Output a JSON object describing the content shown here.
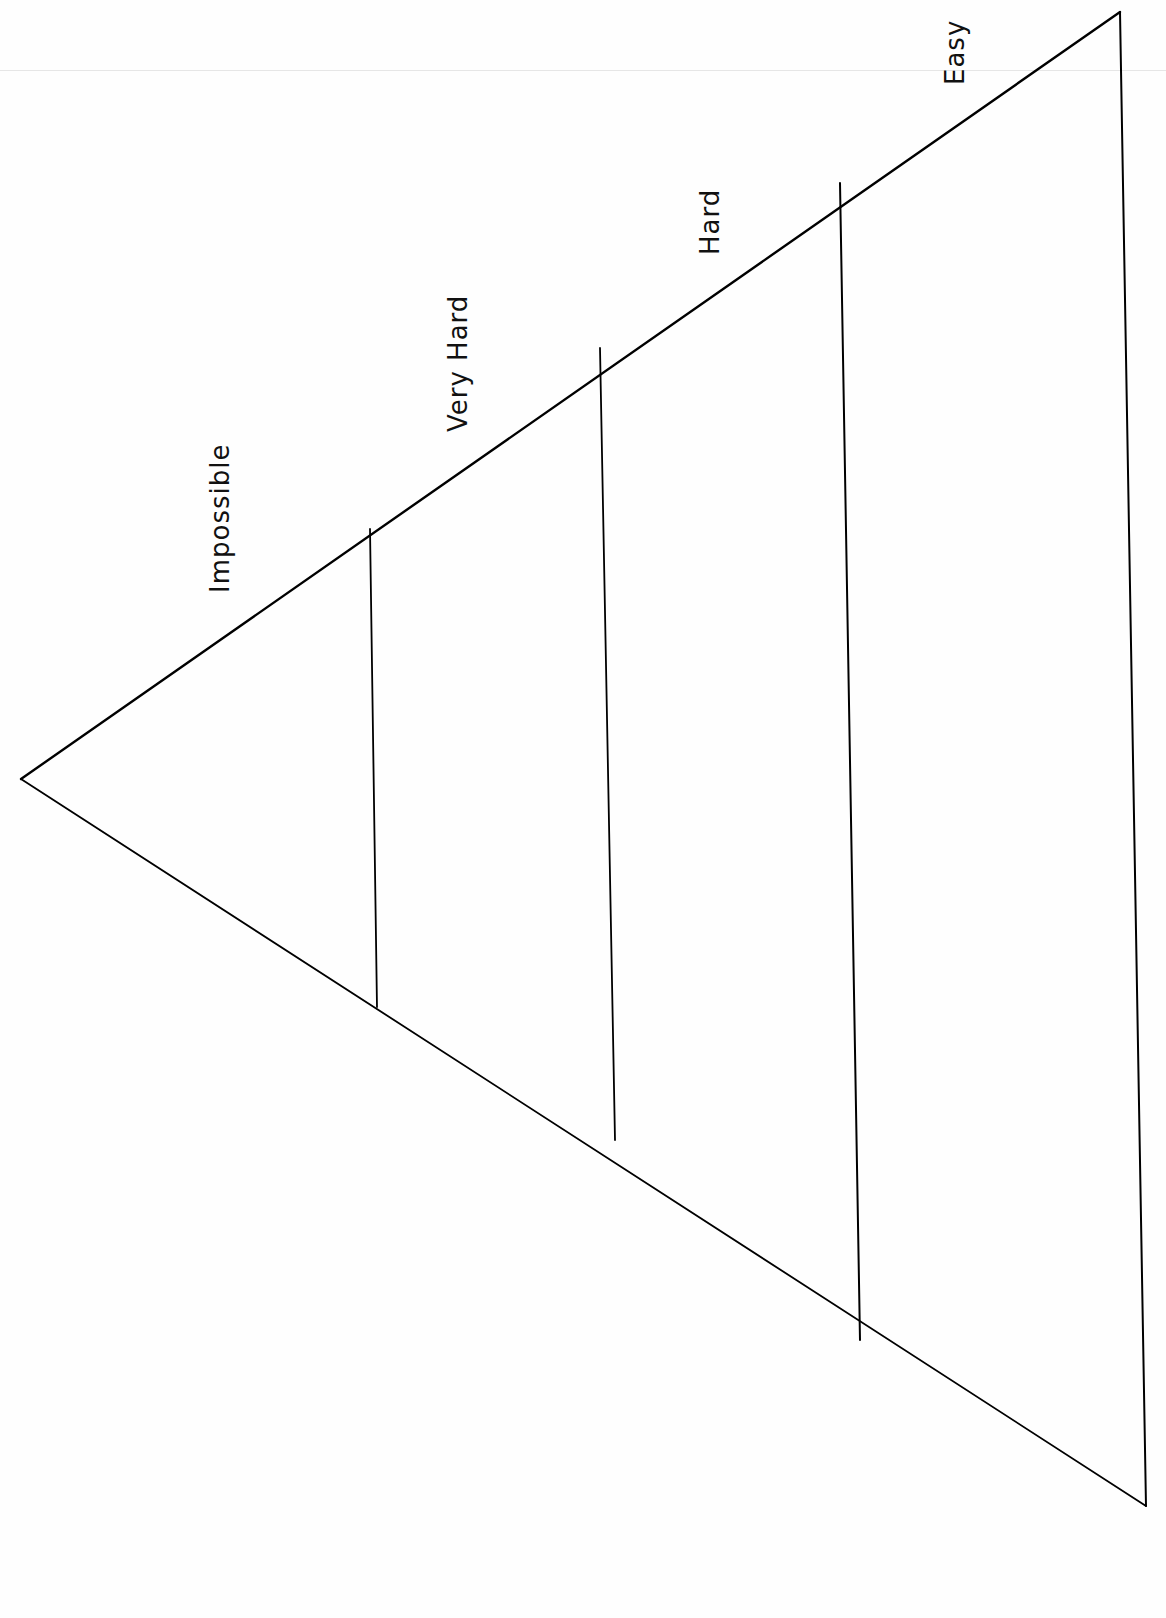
{
  "diagram": {
    "type": "difficulty-pyramid",
    "orientation": "rotated-left",
    "stroke_color": "#000000",
    "background": "#ffffff",
    "vertices": {
      "apex": [
        21,
        779
      ],
      "top_right": [
        1120,
        12
      ],
      "bottom_right": [
        1146,
        1506
      ]
    },
    "dividers": [
      {
        "from": [
          370,
          529
        ],
        "to": [
          377,
          1007
        ]
      },
      {
        "from": [
          600,
          348
        ],
        "to": [
          615,
          1140
        ]
      },
      {
        "from": [
          840,
          183
        ],
        "to": [
          860,
          1340
        ]
      }
    ],
    "levels": [
      {
        "label": "Impossible",
        "x": 205,
        "y": 593
      },
      {
        "label": "Very Hard",
        "x": 443,
        "y": 432
      },
      {
        "label": "Hard",
        "x": 695,
        "y": 255
      },
      {
        "label": "Easy",
        "x": 940,
        "y": 85
      }
    ]
  }
}
